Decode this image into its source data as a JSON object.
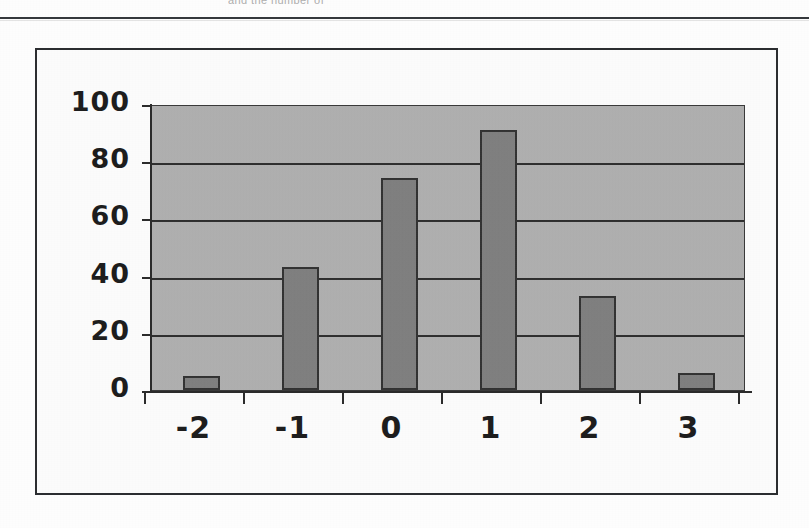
{
  "page": {
    "top_cut_text": "and the number of",
    "background_color": "#fdfdfd",
    "frame_color": "#2b2d30"
  },
  "chart_data": {
    "type": "bar",
    "title": "",
    "subtitle": "",
    "xlabel": "",
    "ylabel": "",
    "categories": [
      "-2",
      "-1",
      "0",
      "1",
      "2",
      "3"
    ],
    "values": [
      5,
      43,
      74,
      91,
      33,
      6
    ],
    "series": [
      {
        "name": "Frequency",
        "values": [
          5,
          43,
          74,
          91,
          33,
          6
        ]
      }
    ],
    "ylim": [
      0,
      100
    ],
    "ytick_labels": [
      "0",
      "20",
      "40",
      "60",
      "80",
      "100"
    ],
    "ytick_values": [
      0,
      20,
      40,
      60,
      80,
      100
    ],
    "xtick_labels": [
      "-2",
      "-1",
      "0",
      "1",
      "2",
      "3"
    ],
    "grid": true,
    "grid_axis": "y",
    "legend": false,
    "legend_position": "none",
    "plot_background_color": "#b0b0b0",
    "bar_color": "#7d7d7d",
    "bar_border_color": "#2a2a2a",
    "gridline_color": "#262626",
    "axis_color": "#2b2b2b",
    "bar_width_ratio": 0.38
  }
}
